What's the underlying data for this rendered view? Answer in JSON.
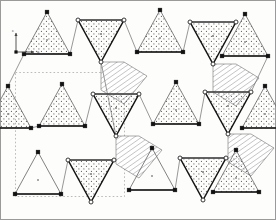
{
  "figure": {
    "name": "triangle-tiling-crystal-structure",
    "title": "",
    "background_color": "#fdfdfc",
    "border_color": "#9a9a9a",
    "width": 276,
    "height": 220
  },
  "axes": {
    "origin": [
      16,
      52
    ],
    "x_label": "a",
    "y_label": "c",
    "x_end": [
      34,
      52
    ],
    "y_end": [
      16,
      33
    ],
    "color": "#444444"
  },
  "unit_cell": {
    "label": "",
    "style": "dashed",
    "color": "#aaaaaa",
    "x0": 15.5,
    "y0": 72.5,
    "x1": 124.5,
    "y1": 196.5
  },
  "legend": {
    "up_triangle": "up-pointing tetrahedron, dotted fill, filled square vertices",
    "down_triangle": "down-pointing tetrahedron, dotted fill, open circle vertices",
    "hatched": "hatched octahedral / linking polygon"
  },
  "chart_data": {
    "type": "scatter",
    "title": "",
    "xlabel": "a",
    "ylabel": "c",
    "vertex_marker_filled": "square",
    "vertex_marker_open": "circle",
    "triangles_up": [
      {
        "id": "u1",
        "pts": [
          [
            47,
            12
          ],
          [
            24,
            54
          ],
          [
            70,
            54
          ]
        ],
        "fill": "dots",
        "vertex": "square",
        "stroke": "thin"
      },
      {
        "id": "u2",
        "pts": [
          [
            160,
            10
          ],
          [
            137,
            52
          ],
          [
            183,
            52
          ]
        ],
        "fill": "dots",
        "vertex": "square",
        "stroke": "thin"
      },
      {
        "id": "u3",
        "pts": [
          [
            245,
            14
          ],
          [
            222,
            56
          ],
          [
            268,
            56
          ]
        ],
        "fill": "dots",
        "vertex": "square",
        "stroke": "thin"
      },
      {
        "id": "u4",
        "pts": [
          [
            62,
            84
          ],
          [
            39,
            126
          ],
          [
            85,
            126
          ]
        ],
        "fill": "dots",
        "vertex": "square",
        "stroke": "thin"
      },
      {
        "id": "u5",
        "pts": [
          [
            176,
            82
          ],
          [
            153,
            124
          ],
          [
            199,
            124
          ]
        ],
        "fill": "dots",
        "vertex": "square",
        "stroke": "thin"
      },
      {
        "id": "u6",
        "pts": [
          [
            38,
            152
          ],
          [
            15,
            194
          ],
          [
            61,
            194
          ]
        ],
        "fill": "none",
        "vertex": "square",
        "stroke": "thin"
      },
      {
        "id": "u7",
        "pts": [
          [
            152,
            148
          ],
          [
            129,
            190
          ],
          [
            175,
            190
          ]
        ],
        "fill": "none",
        "vertex": "square",
        "stroke": "thin"
      },
      {
        "id": "u8",
        "pts": [
          [
            236,
            150
          ],
          [
            213,
            192
          ],
          [
            259,
            192
          ]
        ],
        "fill": "dots",
        "vertex": "square",
        "stroke": "thin"
      },
      {
        "id": "u9",
        "pts": [
          [
            8,
            86
          ],
          [
            -15,
            128
          ],
          [
            31,
            128
          ]
        ],
        "fill": "dots",
        "vertex": "square",
        "stroke": "thin"
      },
      {
        "id": "u10",
        "pts": [
          [
            265,
            86
          ],
          [
            242,
            128
          ],
          [
            288,
            128
          ]
        ],
        "fill": "dots",
        "vertex": "square",
        "stroke": "thin"
      }
    ],
    "triangles_down": [
      {
        "id": "d1",
        "pts": [
          [
            78,
            20
          ],
          [
            124,
            20
          ],
          [
            101,
            62
          ]
        ],
        "fill": "dots",
        "vertex": "circle",
        "stroke": "thick"
      },
      {
        "id": "d2",
        "pts": [
          [
            190,
            22
          ],
          [
            236,
            22
          ],
          [
            213,
            64
          ]
        ],
        "fill": "dots",
        "vertex": "circle",
        "stroke": "thick"
      },
      {
        "id": "d3",
        "pts": [
          [
            93,
            94
          ],
          [
            139,
            94
          ],
          [
            116,
            136
          ]
        ],
        "fill": "dots",
        "vertex": "circle",
        "stroke": "thick"
      },
      {
        "id": "d4",
        "pts": [
          [
            205,
            92
          ],
          [
            251,
            92
          ],
          [
            228,
            134
          ]
        ],
        "fill": "dots",
        "vertex": "circle",
        "stroke": "thick"
      },
      {
        "id": "d5",
        "pts": [
          [
            68,
            160
          ],
          [
            114,
            160
          ],
          [
            91,
            202
          ]
        ],
        "fill": "dots",
        "vertex": "circle",
        "stroke": "thick"
      },
      {
        "id": "d6",
        "pts": [
          [
            180,
            158
          ],
          [
            226,
            158
          ],
          [
            203,
            200
          ]
        ],
        "fill": "dots",
        "vertex": "circle",
        "stroke": "thick"
      }
    ],
    "hatched_polygons": [
      {
        "id": "h1",
        "pts": [
          [
            101,
            62
          ],
          [
            124,
            62
          ],
          [
            147,
            76
          ],
          [
            124,
            104
          ],
          [
            101,
            90
          ]
        ],
        "fill": "hatch45"
      },
      {
        "id": "h2",
        "pts": [
          [
            213,
            64
          ],
          [
            236,
            64
          ],
          [
            259,
            78
          ],
          [
            236,
            106
          ],
          [
            213,
            92
          ]
        ],
        "fill": "hatch45"
      },
      {
        "id": "h3",
        "pts": [
          [
            116,
            136
          ],
          [
            139,
            136
          ],
          [
            162,
            150
          ],
          [
            139,
            178
          ],
          [
            116,
            164
          ]
        ],
        "fill": "hatch45"
      },
      {
        "id": "h4",
        "pts": [
          [
            228,
            134
          ],
          [
            251,
            134
          ],
          [
            274,
            148
          ],
          [
            251,
            176
          ],
          [
            228,
            162
          ]
        ],
        "fill": "hatch45"
      }
    ],
    "link_bonds": [
      [
        [
          70,
          54
        ],
        [
          78,
          20
        ]
      ],
      [
        [
          24,
          54
        ],
        [
          8,
          86
        ]
      ],
      [
        [
          183,
          52
        ],
        [
          190,
          22
        ]
      ],
      [
        [
          137,
          52
        ],
        [
          124,
          20
        ]
      ],
      [
        [
          268,
          56
        ],
        [
          251,
          92
        ]
      ],
      [
        [
          85,
          126
        ],
        [
          93,
          94
        ]
      ],
      [
        [
          39,
          126
        ],
        [
          31,
          128
        ]
      ],
      [
        [
          199,
          124
        ],
        [
          205,
          92
        ]
      ],
      [
        [
          153,
          124
        ],
        [
          139,
          94
        ]
      ],
      [
        [
          61,
          194
        ],
        [
          68,
          160
        ]
      ],
      [
        [
          175,
          190
        ],
        [
          180,
          158
        ]
      ],
      [
        [
          101,
          62
        ],
        [
          116,
          136
        ]
      ]
    ]
  }
}
